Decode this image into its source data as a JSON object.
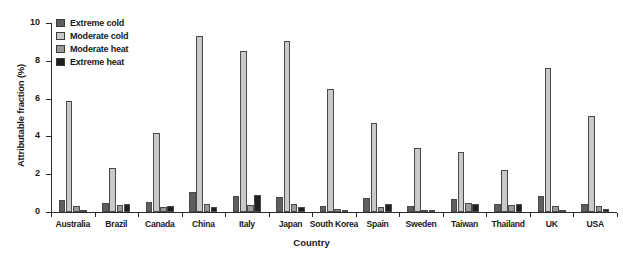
{
  "chart_data": {
    "type": "bar",
    "title": "",
    "xlabel": "Country",
    "ylabel": "Attributable fraction (%)",
    "ylim": [
      0,
      10
    ],
    "yticks": [
      0,
      2,
      4,
      6,
      8,
      10
    ],
    "grid": false,
    "legend_position": "top-left",
    "categories": [
      "Australia",
      "Brazil",
      "Canada",
      "China",
      "Italy",
      "Japan",
      "South Korea",
      "Spain",
      "Sweden",
      "Taiwan",
      "Thailand",
      "UK",
      "USA"
    ],
    "series": [
      {
        "name": "Extreme cold",
        "color": "#5e5e5e",
        "values": [
          0.65,
          0.5,
          0.55,
          1.05,
          0.85,
          0.8,
          0.3,
          0.75,
          0.3,
          0.7,
          0.45,
          0.85,
          0.45
        ]
      },
      {
        "name": "Moderate cold",
        "color": "#c9c9c9",
        "values": [
          5.85,
          2.35,
          4.2,
          9.3,
          8.5,
          9.05,
          6.5,
          4.7,
          3.4,
          3.2,
          2.2,
          7.6,
          5.1
        ]
      },
      {
        "name": "Moderate heat",
        "color": "#9a9a9a",
        "values": [
          0.3,
          0.35,
          0.25,
          0.4,
          0.35,
          0.45,
          0.15,
          0.25,
          0.12,
          0.5,
          0.35,
          0.3,
          0.3
        ]
      },
      {
        "name": "Extreme heat",
        "color": "#1f1f1f",
        "values": [
          0.12,
          0.42,
          0.3,
          0.25,
          0.9,
          0.25,
          0.05,
          0.42,
          0.04,
          0.42,
          0.42,
          0.1,
          0.18
        ]
      }
    ]
  },
  "axes": {
    "ylabel": "Attributable fraction (%)",
    "xlabel": "Country",
    "ytick_labels": [
      "0",
      "2",
      "4",
      "6",
      "8",
      "10"
    ]
  },
  "legend": {
    "items": [
      {
        "label": "Extreme cold",
        "color": "#5e5e5e"
      },
      {
        "label": "Moderate cold",
        "color": "#c9c9c9"
      },
      {
        "label": "Moderate heat",
        "color": "#9a9a9a"
      },
      {
        "label": "Extreme heat",
        "color": "#1f1f1f"
      }
    ]
  }
}
